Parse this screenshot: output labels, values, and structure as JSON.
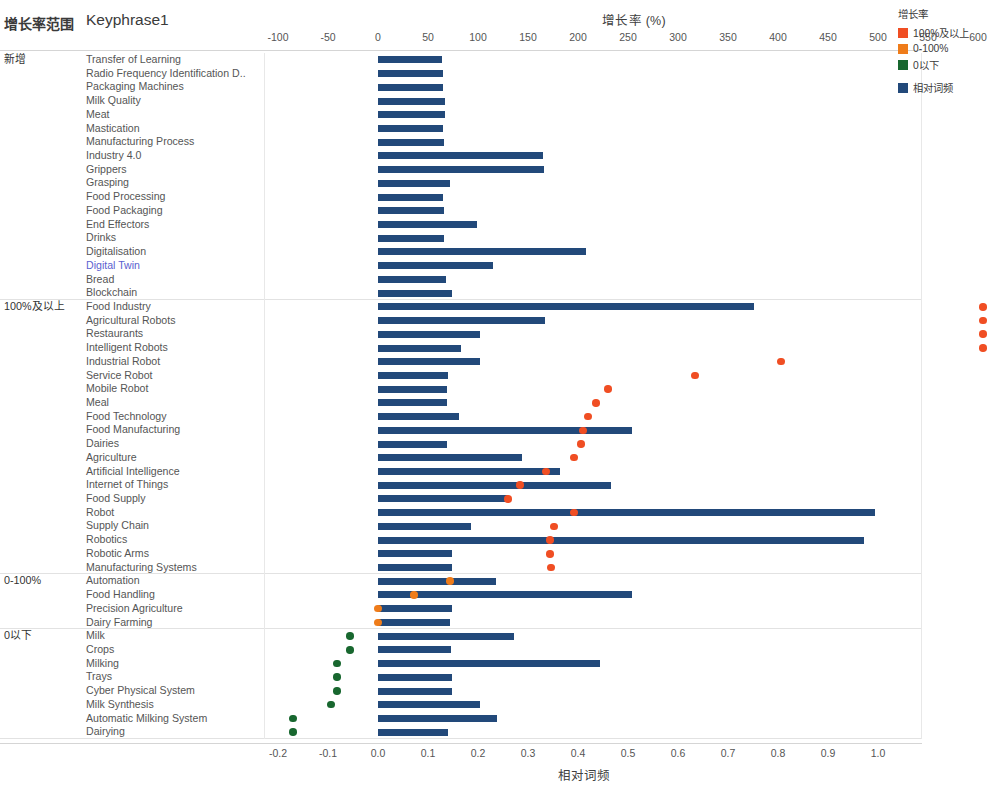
{
  "header": {
    "range_column": "增长率范围",
    "keyphrase_column": "Keyphrase1"
  },
  "legend": {
    "title": "增长率",
    "items": [
      {
        "label": "100%及以上",
        "color": "#f04e23"
      },
      {
        "label": "0-100%",
        "color": "#ef7c1a"
      },
      {
        "label": "0以下",
        "color": "#18672f"
      },
      {
        "label": "相对词频",
        "color": "#22497a"
      }
    ]
  },
  "chart_data": {
    "type": "bar",
    "title": "增长率 (%)",
    "xlabel": "相对词频",
    "x2label": "增长率 (%)",
    "ylabel": "Keyphrase1",
    "grid": false,
    "legend_position": "top-right",
    "top_axis": {
      "label": "增长率 (%)",
      "ticks": [
        -100,
        -50,
        0,
        50,
        100,
        150,
        200,
        250,
        300,
        350,
        400,
        450,
        500,
        550,
        600
      ],
      "range": [
        -125,
        615
      ]
    },
    "bottom_axis": {
      "label": "相对词频",
      "ticks": [
        "-0.2",
        "-0.1",
        "0.0",
        "0.1",
        "0.2",
        "0.3",
        "0.4",
        "0.5",
        "0.6",
        "0.7",
        "0.8",
        "0.9",
        "1.0"
      ],
      "range": [
        -0.25,
        1.03
      ]
    },
    "series": [
      {
        "name": "相对词频",
        "type": "bar",
        "color": "#22497a",
        "axis": "bottom"
      },
      {
        "name": "增长率",
        "type": "scatter",
        "axis": "top"
      }
    ],
    "groups": [
      {
        "name": "新增",
        "rows": [
          {
            "label": "Transfer of Learning",
            "freq": 0.128,
            "growth": null
          },
          {
            "label": "Radio Frequency Identification D..",
            "freq": 0.129,
            "growth": null
          },
          {
            "label": "Packaging Machines",
            "freq": 0.13,
            "growth": null
          },
          {
            "label": "Milk Quality",
            "freq": 0.134,
            "growth": null
          },
          {
            "label": "Meat",
            "freq": 0.134,
            "growth": null
          },
          {
            "label": "Mastication",
            "freq": 0.13,
            "growth": null
          },
          {
            "label": "Manufacturing Process",
            "freq": 0.131,
            "growth": null
          },
          {
            "label": "Industry 4.0",
            "freq": 0.33,
            "growth": null
          },
          {
            "label": "Grippers",
            "freq": 0.331,
            "growth": null
          },
          {
            "label": "Grasping",
            "freq": 0.143,
            "growth": null
          },
          {
            "label": "Food Processing",
            "freq": 0.13,
            "growth": null
          },
          {
            "label": "Food Packaging",
            "freq": 0.131,
            "growth": null
          },
          {
            "label": "End Effectors",
            "freq": 0.198,
            "growth": null
          },
          {
            "label": "Drinks",
            "freq": 0.132,
            "growth": null
          },
          {
            "label": "Digitalisation",
            "freq": 0.415,
            "growth": null
          },
          {
            "label": "Digital Twin",
            "freq": 0.23,
            "growth": null
          },
          {
            "label": "Bread",
            "freq": 0.135,
            "growth": null
          },
          {
            "label": "Blockchain",
            "freq": 0.147,
            "growth": null
          }
        ]
      },
      {
        "name": "100%及以上",
        "rows": [
          {
            "label": "Food Industry",
            "freq": 0.752,
            "growth": 605
          },
          {
            "label": "Agricultural Robots",
            "freq": 0.334,
            "growth": 605
          },
          {
            "label": "Restaurants",
            "freq": 0.204,
            "growth": 605
          },
          {
            "label": "Intelligent Robots",
            "freq": 0.165,
            "growth": 605
          },
          {
            "label": "Industrial Robot",
            "freq": 0.203,
            "growth": 403
          },
          {
            "label": "Service Robot",
            "freq": 0.14,
            "growth": 317
          },
          {
            "label": "Mobile Robot",
            "freq": 0.138,
            "growth": 230
          },
          {
            "label": "Meal",
            "freq": 0.138,
            "growth": 218
          },
          {
            "label": "Food Technology",
            "freq": 0.162,
            "growth": 210
          },
          {
            "label": "Food Manufacturing",
            "freq": 0.508,
            "growth": 205
          },
          {
            "label": "Dairies",
            "freq": 0.137,
            "growth": 203
          },
          {
            "label": "Agriculture",
            "freq": 0.287,
            "growth": 196
          },
          {
            "label": "Artificial Intelligence",
            "freq": 0.363,
            "growth": 168
          },
          {
            "label": "Internet of Things",
            "freq": 0.465,
            "growth": 142
          },
          {
            "label": "Food Supply",
            "freq": 0.26,
            "growth": 130
          },
          {
            "label": "Robot",
            "freq": 0.993,
            "growth": 196
          },
          {
            "label": "Supply Chain",
            "freq": 0.185,
            "growth": 176
          },
          {
            "label": "Robotics",
            "freq": 0.972,
            "growth": 172
          },
          {
            "label": "Robotic Arms",
            "freq": 0.148,
            "growth": 172
          },
          {
            "label": "Manufacturing Systems",
            "freq": 0.148,
            "growth": 173
          }
        ]
      },
      {
        "name": "0-100%",
        "rows": [
          {
            "label": "Automation",
            "freq": 0.235,
            "growth": 72
          },
          {
            "label": "Food Handling",
            "freq": 0.508,
            "growth": 36
          },
          {
            "label": "Precision Agriculture",
            "freq": 0.148,
            "growth": 0
          },
          {
            "label": "Dairy Farming",
            "freq": 0.143,
            "growth": 0
          }
        ]
      },
      {
        "name": "0以下",
        "rows": [
          {
            "label": "Milk",
            "freq": 0.272,
            "growth": -28
          },
          {
            "label": "Crops",
            "freq": 0.146,
            "growth": -28
          },
          {
            "label": "Milking",
            "freq": 0.443,
            "growth": -41
          },
          {
            "label": "Trays",
            "freq": 0.148,
            "growth": -41
          },
          {
            "label": "Cyber Physical System",
            "freq": 0.148,
            "growth": -41
          },
          {
            "label": "Milk Synthesis",
            "freq": 0.203,
            "growth": -47
          },
          {
            "label": "Automatic Milking System",
            "freq": 0.238,
            "growth": -85
          },
          {
            "label": "Dairying",
            "freq": 0.14,
            "growth": -85
          }
        ]
      }
    ]
  }
}
